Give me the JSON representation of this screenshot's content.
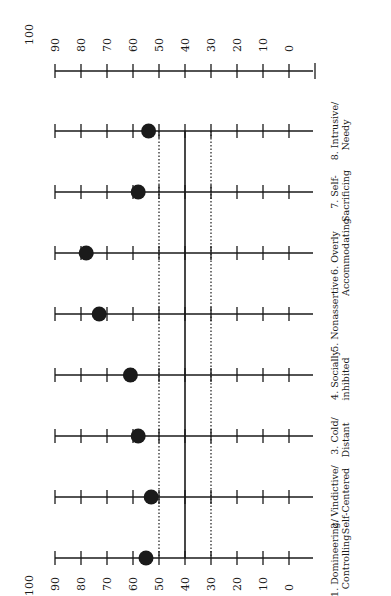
{
  "chart_data": {
    "type": "scatter",
    "orientation": "rotated-90",
    "title": "",
    "xlabel": "",
    "ylabel": "",
    "scale_ticks": [
      0,
      10,
      20,
      30,
      40,
      50,
      60,
      70,
      80,
      90,
      100
    ],
    "ylim": [
      0,
      100
    ],
    "reference_lines": [
      {
        "value": 50,
        "style": "dotted"
      },
      {
        "value": 40,
        "style": "solid"
      },
      {
        "value": 30,
        "style": "dotted"
      }
    ],
    "categories": [
      {
        "num": "1.",
        "line1": "1. Domineering/",
        "line2": "Controlling",
        "value": 55
      },
      {
        "num": "2.",
        "line1": "2. Vindictive/",
        "line2": "Self-Centered",
        "value": 53
      },
      {
        "num": "3.",
        "line1": "3. Cold/",
        "line2": "Distant",
        "value": 58
      },
      {
        "num": "4.",
        "line1": "4. Socially",
        "line2": "inhibited",
        "value": 61
      },
      {
        "num": "5.",
        "line1": "5. Nonassertive",
        "line2": "",
        "value": 73
      },
      {
        "num": "6.",
        "line1": "6. Overly",
        "line2": "Accommodating",
        "value": 78
      },
      {
        "num": "7.",
        "line1": "7. Self-",
        "line2": "Sacrificing",
        "value": 58
      },
      {
        "num": "8.",
        "line1": "8. Intrusive/",
        "line2": "Needy",
        "value": 54
      }
    ],
    "legend": "none",
    "grid": false
  },
  "axis": {
    "labels": [
      "100",
      "90",
      "80",
      "70",
      "60",
      "50",
      "40",
      "30",
      "20",
      "10",
      "0"
    ]
  },
  "colors": {
    "ink": "#1a1a1a",
    "background": "#ffffff"
  }
}
